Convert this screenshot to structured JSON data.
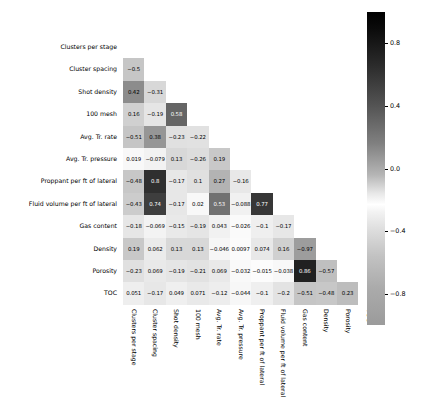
{
  "chart_data": {
    "type": "heatmap",
    "title": "",
    "xlabel": "",
    "ylabel": "",
    "grid": false,
    "layout": "lower-triangular correlation matrix",
    "colormap": "greys-diverging",
    "colorbar": {
      "position": "right",
      "vmin": -1.0,
      "vmax": 1.0,
      "ticks": [
        0.8,
        0.4,
        0.0,
        -0.4,
        -0.8
      ],
      "tick_labels": [
        "0.8",
        "0.4",
        "0.0",
        "-0.4",
        "-0.8"
      ]
    },
    "categories": [
      "Clusters per stage",
      "Cluster spacing",
      "Shot density",
      "100 mesh",
      "Avg. Tr. rate",
      "Avg. Tr. pressure",
      "Proppant per ft of lateral",
      "Fluid volume per ft of lateral",
      "Gas content",
      "Density",
      "Porosity",
      "TOC"
    ],
    "row_labels": [
      "Clusters per stage",
      "Cluster spacing",
      "Shot density",
      "100 mesh",
      "Avg. Tr. rate",
      "Avg. Tr. pressure",
      "Proppant per ft of lateral",
      "Fluid volume per ft of lateral",
      "Gas content",
      "Density",
      "Porosity",
      "TOC"
    ],
    "column_labels": [
      "Clusters per stage",
      "Cluster spacing",
      "Shot density",
      "100 mesh",
      "Avg. Tr. rate",
      "Avg. Tr. pressure",
      "Proppant per ft of lateral",
      "Fluid volume per ft of lateral",
      "Gas content",
      "Density",
      "Porosity",
      "TOC"
    ],
    "cells": [
      [],
      [
        "-0.5"
      ],
      [
        "0.42",
        "-0.31"
      ],
      [
        "0.16",
        "-0.19",
        "0.58"
      ],
      [
        "-0.51",
        "0.38",
        "-0.23",
        "-0.22"
      ],
      [
        "0.019",
        "-0.079",
        "0.13",
        "-0.26",
        "0.19"
      ],
      [
        "-0.48",
        "0.8",
        "-0.17",
        "0.1",
        "0.27",
        "-0.16"
      ],
      [
        "-0.43",
        "0.74",
        "-0.17",
        "0.02",
        "0.53",
        "-0.088",
        "0.77"
      ],
      [
        "-0.18",
        "-0.069",
        "-0.15",
        "-0.19",
        "0.043",
        "-0.026",
        "-0.1",
        "-0.17"
      ],
      [
        "0.19",
        "0.062",
        "0.13",
        "0.13",
        "-0.046",
        "0.0097",
        "0.074",
        "0.16",
        "-0.97"
      ],
      [
        "-0.23",
        "0.069",
        "-0.19",
        "-0.21",
        "0.069",
        "-0.032",
        "-0.015",
        "-0.038",
        "0.86",
        "-0.57"
      ],
      [
        "0.051",
        "-0.17",
        "0.049",
        "0.071",
        "-0.12",
        "-0.044",
        "-0.1",
        "-0.2",
        "-0.51",
        "-0.48",
        "0.23"
      ]
    ],
    "values": [
      [],
      [
        -0.5
      ],
      [
        0.42,
        -0.31
      ],
      [
        0.16,
        -0.19,
        0.58
      ],
      [
        -0.51,
        0.38,
        -0.23,
        -0.22
      ],
      [
        0.019,
        -0.079,
        0.13,
        -0.26,
        0.19
      ],
      [
        -0.48,
        0.8,
        -0.17,
        0.1,
        0.27,
        -0.16
      ],
      [
        -0.43,
        0.74,
        -0.17,
        0.02,
        0.53,
        -0.088,
        0.77
      ],
      [
        -0.18,
        -0.069,
        -0.15,
        -0.19,
        0.043,
        -0.026,
        -0.1,
        -0.17
      ],
      [
        0.19,
        0.062,
        0.13,
        0.13,
        -0.046,
        0.0097,
        0.074,
        0.16,
        -0.97
      ],
      [
        -0.23,
        0.069,
        -0.19,
        -0.21,
        0.069,
        -0.032,
        -0.015,
        -0.038,
        0.86,
        -0.57
      ],
      [
        0.051,
        -0.17,
        0.049,
        0.071,
        -0.12,
        -0.044,
        -0.1,
        -0.2,
        -0.51,
        -0.48,
        0.23
      ]
    ]
  }
}
